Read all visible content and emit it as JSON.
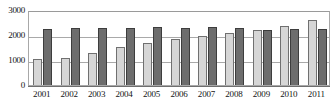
{
  "chart_data": {
    "type": "bar",
    "title": "",
    "subtitle": "",
    "xlabel": "",
    "ylabel": "",
    "categories": [
      "2001",
      "2002",
      "2003",
      "2004",
      "2005",
      "2006",
      "2007",
      "2008",
      "2009",
      "2010",
      "2011"
    ],
    "series": [
      {
        "name": "light-series",
        "color": "#d6d6d6",
        "values": [
          1030,
          1100,
          1270,
          1540,
          1680,
          1840,
          1960,
          2070,
          2210,
          2350,
          2600
        ]
      },
      {
        "name": "dark-series",
        "color": "#6d6d6d",
        "values": [
          2230,
          2270,
          2280,
          2300,
          2330,
          2300,
          2310,
          2280,
          2210,
          2230,
          2250
        ]
      }
    ],
    "ylim": [
      0,
      3000
    ],
    "yticks": [
      0,
      1000,
      2000,
      3000
    ],
    "ytick_labels": [
      "0",
      "1000",
      "2000",
      "3000"
    ],
    "grid": true,
    "grid_axis": "y",
    "legend": false,
    "legend_position": "none",
    "annotations": []
  },
  "colors": {
    "light_bar": "#d6d6d6",
    "light_bar_edge": "#707070",
    "dark_bar": "#6d6d6d",
    "dark_bar_edge": "#3d3d3d",
    "gridline": "#a9a9a9",
    "frame": "#a8a8a8",
    "text": "#141414",
    "background": "#ffffff"
  }
}
